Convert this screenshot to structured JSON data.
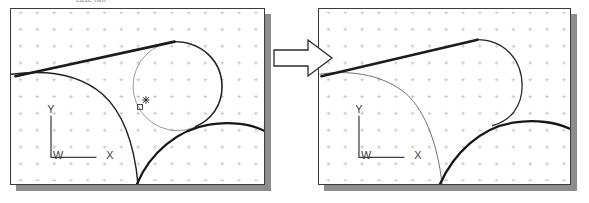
{
  "figure": {
    "top_caption": "case two",
    "arrow_icon": "block-arrow-right-icon",
    "line_color": "#1d1d1d",
    "thin_line_color": "#8a8a8a",
    "grid_color": "#b9b9b9",
    "panel_border_color": "#3a3a3a",
    "shadow_color": "#8d8d8d",
    "background_color": "#ffffff"
  },
  "panels": [
    {
      "id": "before",
      "name": "left-viewport",
      "axes": {
        "origin_label": "W",
        "x_label": "X",
        "y_label": "Y"
      },
      "marker": {
        "icon": "point-marker-icon",
        "glyph": "✶",
        "box_glyph": "□"
      },
      "grid": {
        "spacing_px": 17,
        "glyph": "+",
        "visible": true
      },
      "geometry": [
        {
          "name": "tangent-construction-line",
          "style": "thick"
        },
        {
          "name": "upper-right-arc",
          "style": "thick"
        },
        {
          "name": "left-boundary-arc",
          "style": "thick"
        },
        {
          "name": "lower-right-arc",
          "style": "thick"
        },
        {
          "name": "blend-circle",
          "style": "thin"
        }
      ]
    },
    {
      "id": "after",
      "name": "right-viewport",
      "axes": {
        "origin_label": "W",
        "x_label": "X",
        "y_label": "Y"
      },
      "grid": {
        "spacing_px": 17,
        "glyph": "+",
        "visible": true
      },
      "geometry": [
        {
          "name": "tangent-construction-line",
          "style": "thick"
        },
        {
          "name": "blended-upper-profile",
          "style": "thick"
        },
        {
          "name": "left-boundary-arc",
          "style": "thin"
        },
        {
          "name": "lower-right-arc",
          "style": "thick"
        }
      ]
    }
  ]
}
